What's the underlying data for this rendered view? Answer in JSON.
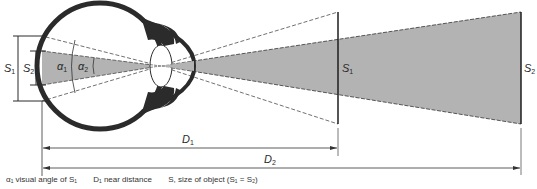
{
  "diagram": {
    "labels": {
      "S1_left": "S",
      "S1_left_sub": "1",
      "S2_left": "S",
      "S2_left_sub": "2",
      "alpha1": "α",
      "alpha1_sub": "1",
      "alpha2": "α",
      "alpha2_sub": "2",
      "S1_object": "S",
      "S1_object_sub": "1",
      "S2_object": "S",
      "S2_object_sub": "2",
      "D1": "D",
      "D1_sub": "1",
      "D2": "D",
      "D2_sub": "2"
    },
    "colors": {
      "shade": "#b3b3b3",
      "eye": "#2b2b2b",
      "line": "#2a2a2a"
    }
  },
  "caption": {
    "item1": "α₁ visual angle of S₁",
    "item2": "D₁ near distance",
    "item3": "S, size of object (S₁ = S₂)"
  }
}
